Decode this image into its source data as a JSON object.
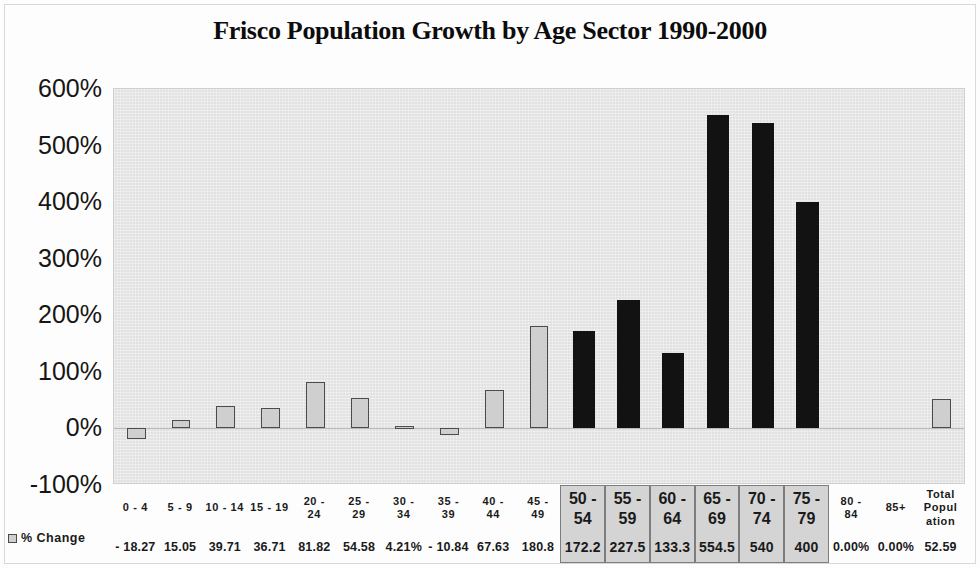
{
  "chart_data": {
    "type": "bar",
    "title": "Frisco Population Growth by Age Sector 1990-2000",
    "xlabel": "",
    "ylabel": "",
    "ylim": [
      -100,
      600
    ],
    "yticks": [
      "600%",
      "500%",
      "400%",
      "300%",
      "200%",
      "100%",
      "0%",
      "-100%"
    ],
    "ytick_values": [
      600,
      500,
      400,
      300,
      200,
      100,
      0,
      -100
    ],
    "grid": false,
    "legend": {
      "position": "bottom-left",
      "entries": [
        {
          "label": "% Change",
          "swatch": "light-gray-outlined"
        }
      ]
    },
    "series": [
      {
        "name": "% Change",
        "categories": [
          "0 - 4",
          "5 - 9",
          "10 - 14",
          "15 - 19",
          "20 - 24",
          "25 - 29",
          "30 - 34",
          "35 - 39",
          "40 - 44",
          "45 - 49",
          "50 - 54",
          "55 - 59",
          "60 - 64",
          "65 - 69",
          "70 - 74",
          "75 - 79",
          "80 - 84",
          "85+",
          "Total Population"
        ],
        "values": [
          -18.27,
          15.05,
          39.71,
          36.71,
          81.82,
          54.58,
          4.21,
          -10.84,
          67.63,
          180.8,
          172.2,
          227.5,
          133.3,
          554.5,
          540,
          400,
          0.0,
          0.0,
          52.59
        ],
        "value_labels": [
          "- 18.27",
          "15.05",
          "39.71",
          "36.71",
          "81.82",
          "54.58",
          "4.21%",
          "- 10.84",
          "67.63",
          "180.8",
          "172.2",
          "227.5",
          "133.3",
          "554.5",
          "540",
          "400",
          "0.00%",
          "0.00%",
          "52.59"
        ],
        "highlighted": [
          false,
          false,
          false,
          false,
          false,
          false,
          false,
          false,
          false,
          false,
          true,
          true,
          true,
          true,
          true,
          true,
          false,
          false,
          false
        ]
      }
    ]
  },
  "table": {
    "category_rows": [
      [
        "0 - 4"
      ],
      [
        "5 - 9"
      ],
      [
        "10 - 14"
      ],
      [
        "15 - 19"
      ],
      [
        "20 -",
        "24"
      ],
      [
        "25 -",
        "29"
      ],
      [
        "30 -",
        "34"
      ],
      [
        "35 -",
        "39"
      ],
      [
        "40 -",
        "44"
      ],
      [
        "45 -",
        "49"
      ],
      [
        "50 -",
        "54"
      ],
      [
        "55 -",
        "59"
      ],
      [
        "60 -",
        "64"
      ],
      [
        "65 -",
        "69"
      ],
      [
        "70 -",
        "74"
      ],
      [
        "75 -",
        "79"
      ],
      [
        "80 -",
        "84"
      ],
      [
        "85+"
      ],
      [
        "Total",
        "Popul",
        "ation"
      ]
    ]
  },
  "colors": {
    "plot_background": "#e9e9e9",
    "bar_light_fill": "#cfcfcf",
    "bar_light_stroke": "#4b4b4b",
    "bar_dark_fill": "#121212",
    "highlight_cell_background": "#d4d4d4",
    "highlight_cell_border": "#7d7d7d",
    "text": "#1a1a1a"
  }
}
